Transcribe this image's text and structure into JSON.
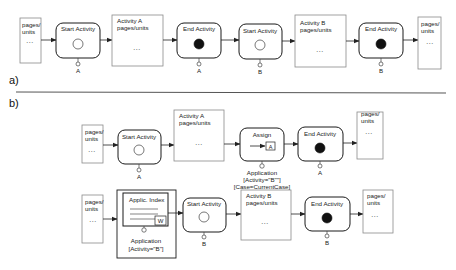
{
  "sections": {
    "a": {
      "label": "a)"
    },
    "b": {
      "label": "b)"
    }
  },
  "common": {
    "pages_label_1": "pages/",
    "pages_label_2": "units",
    "dots": "...",
    "start_activity": "Start Activity",
    "end_activity": "End Activity",
    "activity_a_line1": "Activity A",
    "activity_a_line2": "pages/units",
    "activity_b_line1": "Activity B",
    "activity_b_line2": "pages/units"
  },
  "row_a": {
    "ports": [
      "A",
      "A",
      "B",
      "B"
    ]
  },
  "row_b1": {
    "start_port": "A",
    "assign_title": "Assign",
    "assign_inner": "A",
    "assign_caption": [
      "Application",
      "[Activity=\"B\"\"]",
      "[Case=CurrentCase]"
    ],
    "end_port": "A"
  },
  "row_b2": {
    "applic_index_title": "Applic. Index",
    "applic_index_badge": "W",
    "applic_caption": [
      "Application",
      "[Activity=\"B\"]"
    ],
    "start_port": "B",
    "end_port": "B"
  },
  "colors": {
    "stroke": "#1a1a1a",
    "page_border": "#8a8a8a",
    "end_fill": "#111111",
    "background": "#ffffff"
  }
}
